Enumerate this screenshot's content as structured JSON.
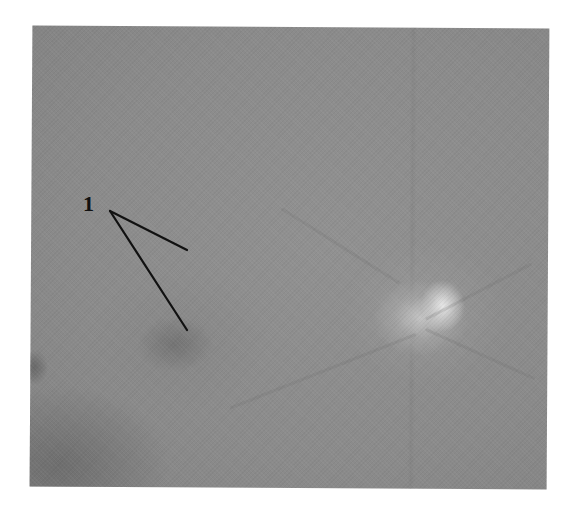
{
  "figure": {
    "type": "grayscale fundus photograph",
    "annotations": [
      {
        "label": "1",
        "pointers": [
          {
            "from": [
              110,
              211
            ],
            "to": [
              187,
              250
            ]
          },
          {
            "from": [
              110,
              211
            ],
            "to": [
              187,
              330
            ]
          }
        ]
      }
    ],
    "features": {
      "optic_disc": {
        "center": [
          412,
          310
        ]
      },
      "macula_dark_spot": {
        "center": [
          180,
          342
        ]
      }
    },
    "colors": {
      "background": "#ffffff",
      "photo_gray": "#8c8c8c",
      "optic_disc": "#e6e6e6",
      "annotation_ink": "#111111"
    }
  }
}
